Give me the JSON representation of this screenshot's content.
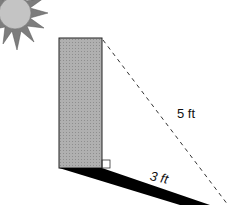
{
  "diagram": {
    "type": "shadow-right-triangle",
    "labels": {
      "hypotenuse": "5 ft",
      "shadow": "3 ft"
    },
    "elements": [
      "sun",
      "building",
      "shadow",
      "sun-ray-dashed-line",
      "right-angle-marker"
    ],
    "colors": {
      "sun_fill": "#bdbdbd",
      "sun_rays": "#8a8a8a",
      "building_fill": "#a8a8a8",
      "shadow_fill": "#000000",
      "dashed_line": "#333333"
    }
  }
}
